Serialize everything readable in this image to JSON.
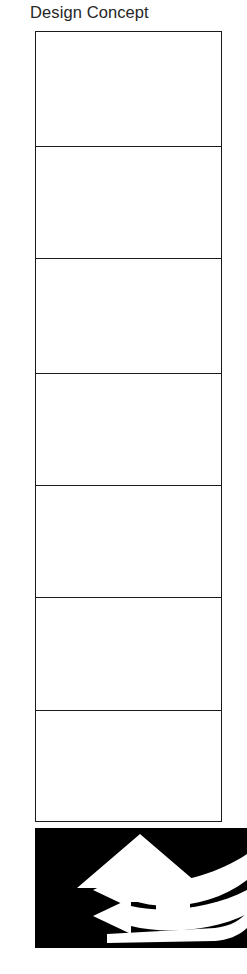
{
  "page": {
    "title": "Design Concept",
    "background_color": "#ffffff",
    "ink_color": "#1a1a1a"
  },
  "concept_table": {
    "border_color": "#1a1a1a",
    "rows": [
      {
        "label": "row-1",
        "text": ""
      },
      {
        "label": "row-2",
        "text": ""
      },
      {
        "label": "row-3",
        "text": ""
      },
      {
        "label": "row-4",
        "text": ""
      },
      {
        "label": "row-5",
        "text": ""
      },
      {
        "label": "row-6",
        "text": ""
      },
      {
        "label": "row-7",
        "text": ""
      }
    ]
  },
  "illustration": {
    "name": "house-arrow-with-ribbon-arrows",
    "background_color": "#000000",
    "figure_color": "#ffffff",
    "elements": [
      "up-arrow-house-shape",
      "ribbon-arrow-upper-left",
      "ribbon-arrow-lower-left",
      "ribbon-band-bottom"
    ]
  }
}
